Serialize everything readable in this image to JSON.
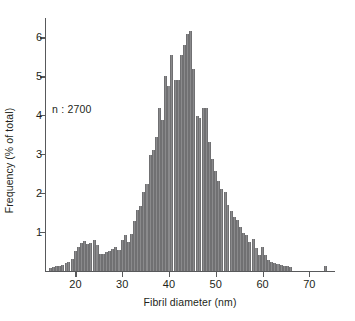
{
  "chart_data": {
    "type": "bar",
    "title": "",
    "subtitle": "",
    "xlabel": "Fibril diameter (nm)",
    "ylabel": "Frequency (% of total)",
    "annotation": "n : 2700",
    "grid": false,
    "legend": null,
    "xlim": [
      13.5,
      75.5
    ],
    "ylim": [
      0,
      6.5
    ],
    "xticks": [
      20,
      30,
      40,
      50,
      60,
      70
    ],
    "xtick_labels": [
      "20",
      "30",
      "40",
      "50",
      "60",
      "70"
    ],
    "yticks": [
      1,
      2,
      3,
      4,
      5,
      6
    ],
    "ytick_labels": [
      "1",
      "2",
      "3",
      "4",
      "5",
      "6"
    ],
    "bin_width": 0.66,
    "bar_color": "#8a8a8c",
    "axis_color": "#58595b",
    "text_color": "#231f20",
    "x": [
      14.4,
      15.1,
      15.8,
      16.4,
      17.1,
      17.8,
      18.4,
      19.1,
      19.8,
      20.4,
      21.1,
      21.8,
      22.4,
      23.1,
      23.8,
      24.4,
      25.1,
      25.8,
      26.4,
      27.1,
      27.8,
      28.4,
      29.1,
      29.8,
      30.4,
      31.1,
      31.8,
      32.4,
      33.1,
      33.8,
      34.4,
      35.1,
      35.8,
      36.4,
      37.1,
      37.8,
      38.4,
      39.1,
      39.8,
      40.4,
      41.1,
      41.8,
      42.4,
      43.1,
      43.8,
      44.4,
      45.1,
      45.8,
      46.4,
      47.1,
      47.8,
      48.4,
      49.1,
      49.8,
      50.4,
      51.1,
      51.8,
      52.4,
      53.1,
      53.8,
      54.4,
      55.1,
      55.8,
      56.4,
      57.1,
      57.8,
      58.4,
      59.1,
      59.8,
      60.4,
      61.1,
      61.8,
      62.4,
      63.1,
      63.8,
      64.4,
      65.1,
      65.8,
      73.2
    ],
    "values": [
      0.08,
      0.1,
      0.12,
      0.14,
      0.16,
      0.2,
      0.22,
      0.3,
      0.52,
      0.62,
      0.72,
      0.76,
      0.7,
      0.72,
      0.8,
      0.68,
      0.45,
      0.44,
      0.5,
      0.52,
      0.56,
      0.62,
      0.55,
      0.8,
      0.92,
      0.75,
      0.96,
      1.28,
      1.58,
      1.66,
      2.02,
      2.24,
      2.98,
      3.12,
      3.44,
      4.18,
      3.88,
      5.0,
      4.76,
      5.56,
      4.9,
      4.92,
      5.54,
      5.8,
      6.1,
      6.16,
      5.2,
      3.98,
      3.92,
      4.2,
      4.18,
      3.32,
      2.88,
      2.58,
      2.32,
      2.1,
      2.04,
      1.7,
      1.54,
      1.4,
      1.32,
      1.12,
      0.98,
      0.92,
      0.74,
      0.82,
      0.6,
      0.42,
      0.62,
      0.4,
      0.28,
      0.22,
      0.2,
      0.18,
      0.16,
      0.14,
      0.12,
      0.1,
      0.14
    ]
  }
}
